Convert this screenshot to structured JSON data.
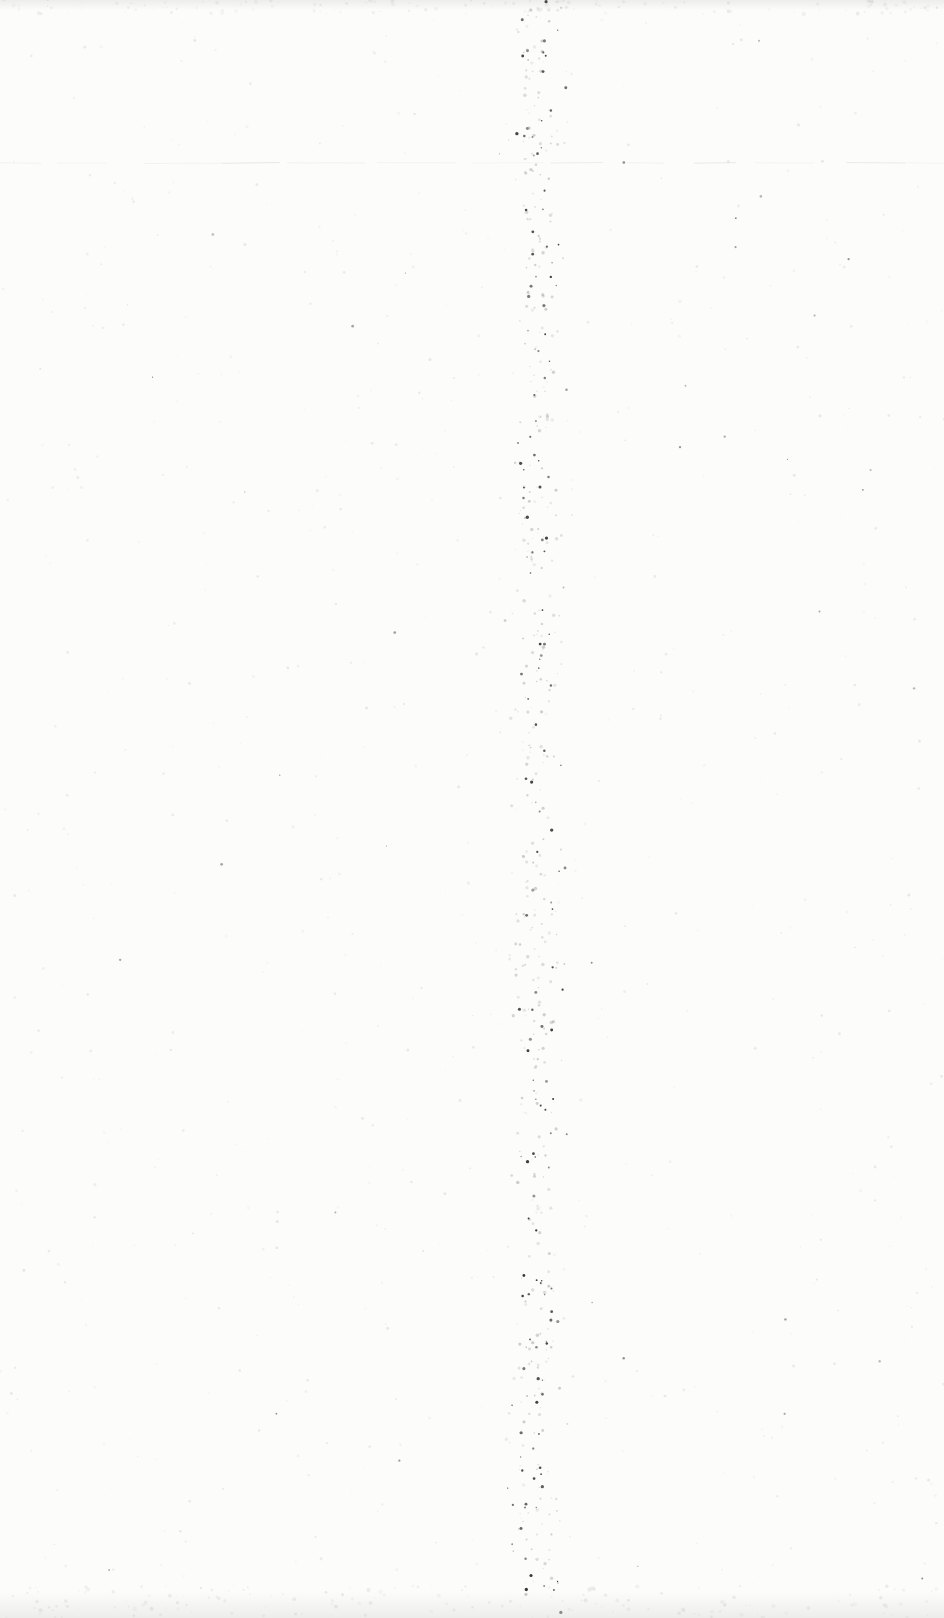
{
  "page": {
    "kind": "blank-scanned-book-page",
    "width": 944,
    "height": 1618,
    "background_color": "#fcfcfa",
    "edge_shade_color": "#ededeb",
    "top_edge_height": 10,
    "bottom_edge_height": 26,
    "crease_line": {
      "y": 163,
      "color": "#b4b4ae",
      "opacity": 0.28
    },
    "gutter_band": {
      "center_x": 537,
      "sigma": 22,
      "speck_count": 560,
      "dark_color": "#2e2e2a",
      "mid_color": "#8a8a84"
    },
    "scatter": {
      "speck_count": 700,
      "color": "#b5b5ae"
    },
    "sparse_dark": {
      "speck_count": 45,
      "color": "#4a4a44"
    },
    "seed": 20240615
  }
}
